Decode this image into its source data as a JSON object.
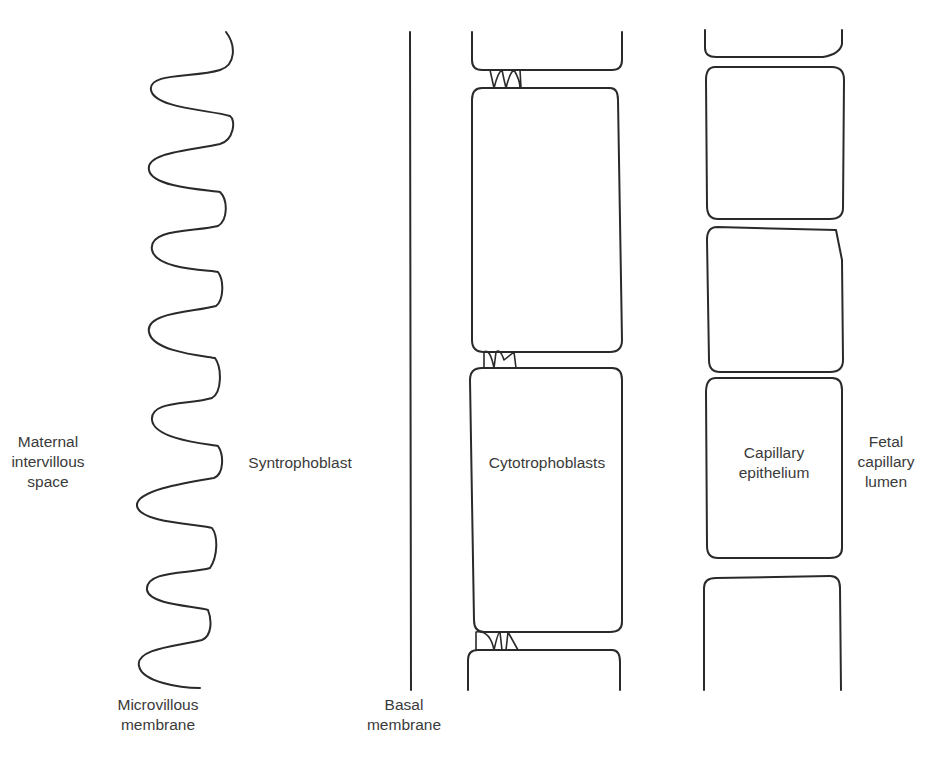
{
  "diagram": {
    "kind": "placental-barrier-schematic",
    "stroke_color": "#2a2a2a",
    "text_color": "#3a3a3a",
    "background": "#ffffff"
  },
  "labels": {
    "maternal_space": {
      "lines": [
        "Maternal",
        "intervillous",
        "space"
      ]
    },
    "syntrophoblast": {
      "lines": [
        "Syntrophoblast"
      ]
    },
    "microvillous_membrane": {
      "lines": [
        "Microvillous",
        "membrane"
      ]
    },
    "basal_membrane": {
      "lines": [
        "Basal",
        "membrane"
      ]
    },
    "cytotrophoblasts": {
      "lines": [
        "Cytotrophoblasts"
      ]
    },
    "capillary_epithelium": {
      "lines": [
        "Capillary",
        "epithelium"
      ]
    },
    "fetal_capillary_lumen": {
      "lines": [
        "Fetal",
        "capillary",
        "lumen"
      ]
    }
  },
  "layers": [
    {
      "name": "Microvillous membrane (wavy)",
      "x_range": [
        135,
        235
      ],
      "y_range": [
        32,
        688
      ]
    },
    {
      "name": "Basal membrane (line)",
      "x": 410,
      "y_range": [
        32,
        690
      ]
    },
    {
      "name": "Cytotrophoblast cells",
      "x_range": [
        468,
        622
      ],
      "cells": 4
    },
    {
      "name": "Capillary epithelial cells",
      "x_range": [
        704,
        842
      ],
      "cells": 5
    }
  ]
}
